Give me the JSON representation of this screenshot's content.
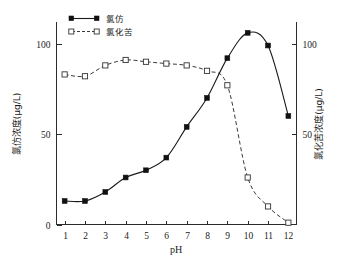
{
  "chart_data": {
    "type": "line",
    "title": "",
    "xlabel": "pH",
    "x": [
      1,
      2,
      3,
      4,
      5,
      6,
      7,
      8,
      9,
      10,
      11,
      12
    ],
    "xticklabels": [
      "1",
      "2",
      "3",
      "4",
      "5",
      "6",
      "7",
      "8",
      "9",
      "10",
      "11",
      "12"
    ],
    "xlim": [
      0.6,
      12.4
    ],
    "grid": false,
    "legend_position": "top-left",
    "axes": [
      {
        "id": "left",
        "label": "氯仿浓度(μg/L)",
        "ylim": [
          0,
          112
        ],
        "yticks": [
          0,
          50,
          100
        ],
        "yticklabels": [
          "0",
          "50",
          "100"
        ]
      },
      {
        "id": "right",
        "label": "氯化苦浓度(μg/L)",
        "ylim": [
          0,
          112
        ],
        "yticks": [
          50,
          100
        ],
        "yticklabels": [
          "50",
          "100"
        ]
      }
    ],
    "series": [
      {
        "name": "氯仿",
        "axis": "left",
        "marker": "filled-square",
        "linestyle": "solid",
        "color": "#1a1a1a",
        "values": [
          13,
          13,
          18,
          26,
          30,
          37,
          54,
          70,
          92,
          106,
          99,
          60
        ]
      },
      {
        "name": "氯化苦",
        "axis": "right",
        "marker": "open-square",
        "linestyle": "dashed",
        "color": "#3a3a3a",
        "values": [
          83,
          82,
          88,
          91,
          90,
          89,
          88,
          85,
          77,
          26,
          10,
          1
        ]
      }
    ],
    "legend": [
      {
        "label": "氯仿",
        "marker": "filled-square",
        "linestyle": "solid"
      },
      {
        "label": "氯化苦",
        "marker": "open-square",
        "linestyle": "dashed"
      }
    ]
  }
}
